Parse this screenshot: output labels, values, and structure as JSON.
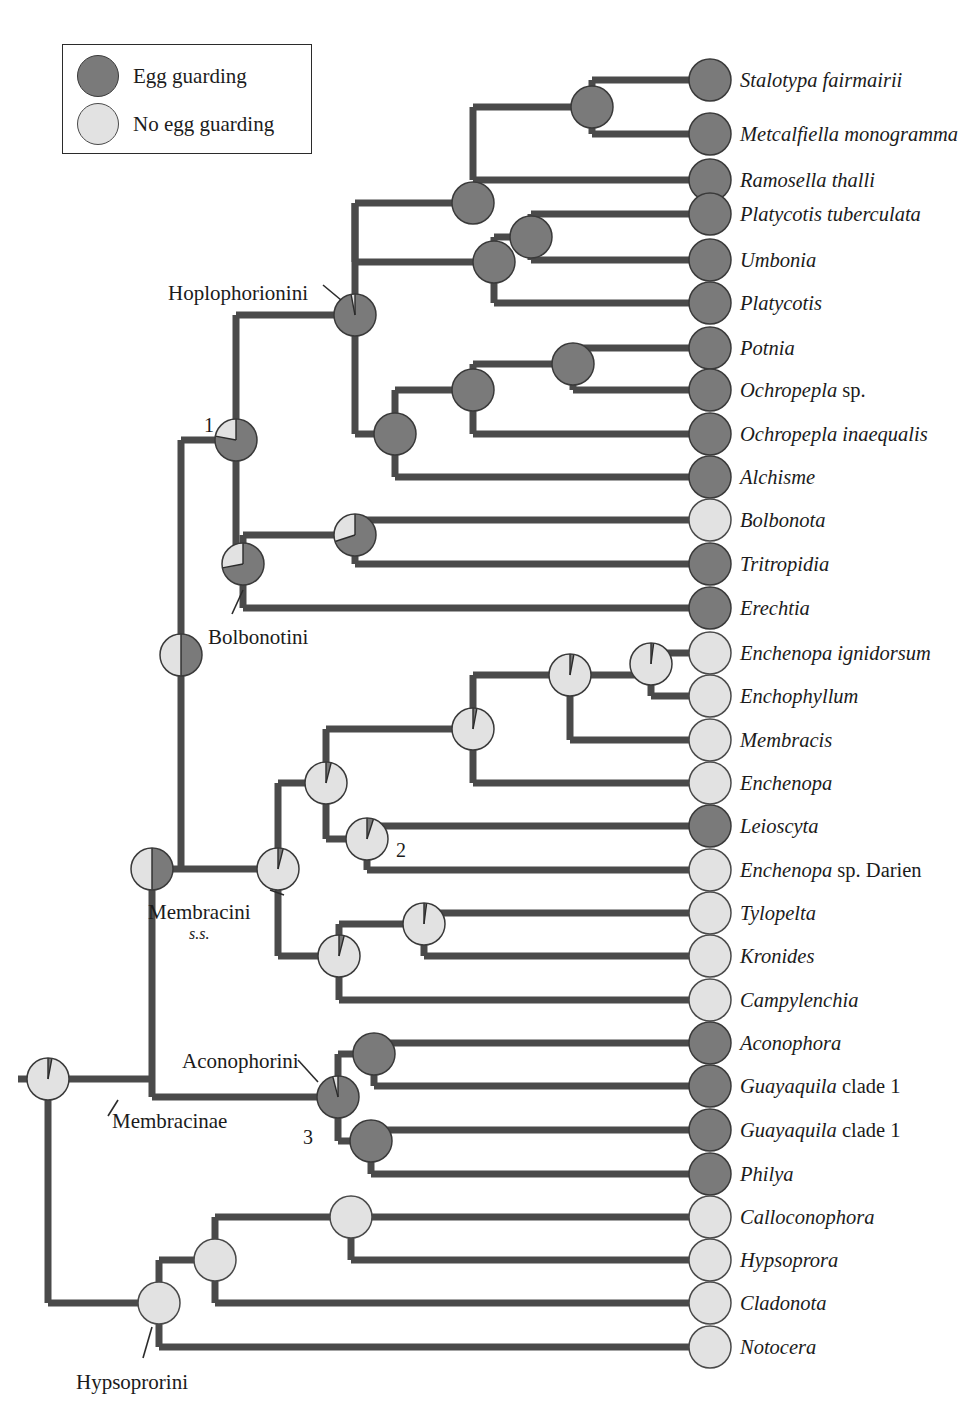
{
  "figure": {
    "type": "phylogenetic-tree",
    "character": "Egg guarding behaviour (maternal care) ancestral state reconstruction",
    "colors": {
      "dark": "#7a7a7a",
      "dark_stroke": "#3a3a3a",
      "light": "#e2e2e2",
      "light_stroke": "#4a4a4a",
      "branch": "#4a4a4a",
      "text": "#1b1b1b"
    }
  },
  "legend": {
    "items": [
      {
        "label": "Egg guarding",
        "state": "dark"
      },
      {
        "label": "No egg guarding",
        "state": "light"
      }
    ]
  },
  "tips": [
    {
      "name": "Stalotypa fairmairii",
      "italic": "Stalotypa fairmairii",
      "roman": "",
      "state": "dark",
      "y": 80
    },
    {
      "name": "Metcalfiella monogramma",
      "italic": "Metcalfiella monogramma",
      "roman": "",
      "state": "dark",
      "y": 134
    },
    {
      "name": "Ramosella thalli",
      "italic": "Ramosella thalli",
      "roman": "",
      "state": "dark",
      "y": 180
    },
    {
      "name": "Platycotis tuberculata",
      "italic": "Platycotis tuberculata",
      "roman": "",
      "state": "dark",
      "y": 214
    },
    {
      "name": "Umbonia",
      "italic": "Umbonia",
      "roman": "",
      "state": "dark",
      "y": 260
    },
    {
      "name": "Platycotis",
      "italic": "Platycotis",
      "roman": "",
      "state": "dark",
      "y": 303
    },
    {
      "name": "Potnia",
      "italic": "Potnia",
      "roman": "",
      "state": "dark",
      "y": 348
    },
    {
      "name": "Ochropepla sp.",
      "italic": "Ochropepla",
      "roman": " sp.",
      "state": "dark",
      "y": 390
    },
    {
      "name": "Ochropepla inaequalis",
      "italic": "Ochropepla inaequalis",
      "roman": "",
      "state": "dark",
      "y": 434
    },
    {
      "name": "Alchisme",
      "italic": "Alchisme",
      "roman": "",
      "state": "dark",
      "y": 477
    },
    {
      "name": "Bolbonota",
      "italic": "Bolbonota",
      "roman": "",
      "state": "light",
      "y": 520
    },
    {
      "name": "Tritropidia",
      "italic": "Tritropidia",
      "roman": "",
      "state": "dark",
      "y": 564
    },
    {
      "name": "Erechtia",
      "italic": "Erechtia",
      "roman": "",
      "state": "dark",
      "y": 608
    },
    {
      "name": "Enchenopa ignidorsum",
      "italic": "Enchenopa ignidorsum",
      "roman": "",
      "state": "light",
      "y": 653
    },
    {
      "name": "Enchophyllum",
      "italic": "Enchophyllum",
      "roman": "",
      "state": "light",
      "y": 696
    },
    {
      "name": "Membracis",
      "italic": "Membracis",
      "roman": "",
      "state": "light",
      "y": 740
    },
    {
      "name": "Enchenopa",
      "italic": "Enchenopa",
      "roman": "",
      "state": "light",
      "y": 783
    },
    {
      "name": "Leioscyta",
      "italic": "Leioscyta",
      "roman": "",
      "state": "dark",
      "y": 826
    },
    {
      "name": "Enchenopa sp. Darien",
      "italic": "Enchenopa",
      "roman": " sp. Darien",
      "state": "light",
      "y": 870
    },
    {
      "name": "Tylopelta",
      "italic": "Tylopelta",
      "roman": "",
      "state": "light",
      "y": 913
    },
    {
      "name": "Kronides",
      "italic": "Kronides",
      "roman": "",
      "state": "light",
      "y": 956
    },
    {
      "name": "Campylenchia",
      "italic": "Campylenchia",
      "roman": "",
      "state": "light",
      "y": 1000
    },
    {
      "name": "Aconophora",
      "italic": "Aconophora",
      "roman": "",
      "state": "dark",
      "y": 1043
    },
    {
      "name": "Guayaquila clade 1 (a)",
      "italic": "Guayaquila",
      "roman": " clade 1",
      "state": "dark",
      "y": 1086
    },
    {
      "name": "Guayaquila clade 1 (b)",
      "italic": "Guayaquila",
      "roman": " clade 1",
      "state": "dark",
      "y": 1130
    },
    {
      "name": "Philya",
      "italic": "Philya",
      "roman": "",
      "state": "dark",
      "y": 1174
    },
    {
      "name": "Calloconophora",
      "italic": "Calloconophora",
      "roman": "",
      "state": "light",
      "y": 1217
    },
    {
      "name": "Hypsoprora",
      "italic": "Hypsoprora",
      "roman": "",
      "state": "light",
      "y": 1260
    },
    {
      "name": "Cladonota",
      "italic": "Cladonota",
      "roman": "",
      "state": "light",
      "y": 1303
    },
    {
      "name": "Notocera",
      "italic": "Notocera",
      "roman": "",
      "state": "light",
      "y": 1347
    }
  ],
  "clade_labels": [
    {
      "text": "Hoplophorionini",
      "sub": "",
      "x": 168,
      "y": 281,
      "align": "left"
    },
    {
      "text": "Bolbonotini",
      "sub": "",
      "x": 208,
      "y": 625,
      "align": "left"
    },
    {
      "text": "Membracini",
      "sub": "s.s.",
      "x": 148,
      "y": 900,
      "align": "left"
    },
    {
      "text": "Aconophorini",
      "sub": "",
      "x": 182,
      "y": 1049,
      "align": "left"
    },
    {
      "text": "Membracinae",
      "sub": "",
      "x": 112,
      "y": 1109,
      "align": "left"
    },
    {
      "text": "Hypsoprorini",
      "sub": "",
      "x": 76,
      "y": 1370,
      "align": "left"
    }
  ],
  "node_numbers": [
    {
      "text": "1",
      "x": 204,
      "y": 414
    },
    {
      "text": "2",
      "x": 396,
      "y": 839
    },
    {
      "text": "3",
      "x": 303,
      "y": 1126
    }
  ],
  "internal_nodes": [
    {
      "id": "root",
      "x": 48,
      "y": 1079,
      "dark_frac": 0.03
    },
    {
      "id": "membracinae",
      "x": 48,
      "y": 1079,
      "dark_frac": 0.03
    },
    {
      "id": "n-upper",
      "x": 181,
      "y": 655,
      "dark_frac": 0.5
    },
    {
      "id": "n-membracinae2",
      "x": 152,
      "y": 869,
      "dark_frac": 0.5
    },
    {
      "id": "n1",
      "x": 236,
      "y": 440,
      "dark_frac": 0.78
    },
    {
      "id": "hoplophorionini",
      "x": 355,
      "y": 315,
      "dark_frac": 0.97
    },
    {
      "id": "hopl-a",
      "x": 473,
      "y": 203,
      "dark_frac": 1.0
    },
    {
      "id": "hopl-a1",
      "x": 592,
      "y": 107,
      "dark_frac": 1.0
    },
    {
      "id": "hopl-a2",
      "x": 531,
      "y": 237,
      "dark_frac": 1.0
    },
    {
      "id": "hopl-a3",
      "x": 494,
      "y": 262,
      "dark_frac": 1.0
    },
    {
      "id": "hopl-b",
      "x": 395,
      "y": 434,
      "dark_frac": 1.0
    },
    {
      "id": "hopl-b1",
      "x": 473,
      "y": 390,
      "dark_frac": 1.0
    },
    {
      "id": "hopl-b2",
      "x": 573,
      "y": 364,
      "dark_frac": 1.0
    },
    {
      "id": "bolbonotini",
      "x": 243,
      "y": 564,
      "dark_frac": 0.72
    },
    {
      "id": "bolb-a",
      "x": 355,
      "y": 535,
      "dark_frac": 0.7
    },
    {
      "id": "membracini",
      "x": 278,
      "y": 869,
      "dark_frac": 0.04
    },
    {
      "id": "memb-a",
      "x": 326,
      "y": 783,
      "dark_frac": 0.04
    },
    {
      "id": "memb-a1",
      "x": 473,
      "y": 729,
      "dark_frac": 0.03
    },
    {
      "id": "memb-a2",
      "x": 570,
      "y": 675,
      "dark_frac": 0.03
    },
    {
      "id": "memb-a3",
      "x": 651,
      "y": 664,
      "dark_frac": 0.02
    },
    {
      "id": "n2",
      "x": 367,
      "y": 839,
      "dark_frac": 0.05
    },
    {
      "id": "memb-b",
      "x": 339,
      "y": 956,
      "dark_frac": 0.04
    },
    {
      "id": "memb-b1",
      "x": 424,
      "y": 924,
      "dark_frac": 0.02
    },
    {
      "id": "n3",
      "x": 338,
      "y": 1097,
      "dark_frac": 0.96
    },
    {
      "id": "acon-a",
      "x": 374,
      "y": 1054,
      "dark_frac": 1.0
    },
    {
      "id": "acon-b",
      "x": 371,
      "y": 1141,
      "dark_frac": 1.0
    },
    {
      "id": "hypsoprorini",
      "x": 159,
      "y": 1303,
      "dark_frac": 0.0
    },
    {
      "id": "hyps-a",
      "x": 215,
      "y": 1260,
      "dark_frac": 0.0
    },
    {
      "id": "hyps-a1",
      "x": 351,
      "y": 1217,
      "dark_frac": 0.0
    }
  ],
  "chart_data": {
    "type": "tree",
    "title": "",
    "tip_count": 30,
    "states": [
      "Egg guarding",
      "No egg guarding"
    ],
    "tip_states": [
      "dark",
      "dark",
      "dark",
      "dark",
      "dark",
      "dark",
      "dark",
      "dark",
      "dark",
      "dark",
      "light",
      "dark",
      "dark",
      "light",
      "light",
      "light",
      "light",
      "dark",
      "light",
      "light",
      "light",
      "light",
      "dark",
      "dark",
      "dark",
      "dark",
      "light",
      "light",
      "light",
      "light"
    ]
  }
}
